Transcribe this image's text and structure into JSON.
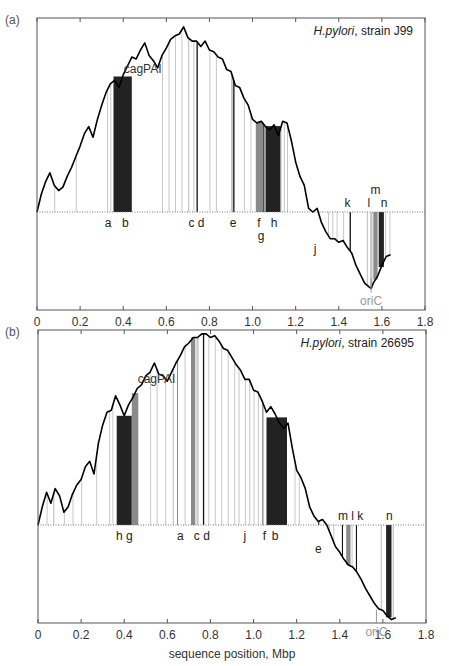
{
  "chart_data": {
    "type": "line",
    "xlabel": "sequence position, Mbp",
    "xlim": [
      0,
      1.8
    ],
    "xticks": [
      "0",
      "0.2",
      "0.4",
      "0.6",
      "0.8",
      "1.0",
      "1.2",
      "1.4",
      "1.6",
      "1.8"
    ],
    "xtick_values": [
      0,
      0.2,
      0.4,
      0.6,
      0.8,
      1.0,
      1.2,
      1.4,
      1.6,
      1.8
    ],
    "grid": false,
    "panels": [
      {
        "label": "(a)",
        "title_italic": "H.pylori",
        "title_rest": ", strain J99",
        "annotation": "cagPAI",
        "annotation_x": 0.49,
        "annotation_y": 0.78,
        "oric_label": "oriC",
        "oric_x": 1.55,
        "ylim": [
          -0.5,
          1.05
        ],
        "curve": {
          "x": [
            0,
            0.02,
            0.04,
            0.06,
            0.08,
            0.1,
            0.12,
            0.14,
            0.16,
            0.18,
            0.2,
            0.22,
            0.24,
            0.26,
            0.28,
            0.3,
            0.32,
            0.34,
            0.36,
            0.38,
            0.4,
            0.42,
            0.44,
            0.46,
            0.48,
            0.5,
            0.52,
            0.54,
            0.56,
            0.58,
            0.6,
            0.62,
            0.64,
            0.66,
            0.68,
            0.7,
            0.72,
            0.74,
            0.76,
            0.78,
            0.8,
            0.82,
            0.84,
            0.86,
            0.88,
            0.9,
            0.92,
            0.94,
            0.96,
            0.98,
            1.0,
            1.02,
            1.04,
            1.06,
            1.08,
            1.1,
            1.12,
            1.14,
            1.16,
            1.18,
            1.2,
            1.22,
            1.24,
            1.26,
            1.28,
            1.3,
            1.32,
            1.34,
            1.36,
            1.38,
            1.4,
            1.42,
            1.44,
            1.46,
            1.48,
            1.5,
            1.52,
            1.54,
            1.55,
            1.56,
            1.58,
            1.6,
            1.62,
            1.64
          ],
          "y": [
            0.0,
            0.1,
            0.17,
            0.22,
            0.15,
            0.12,
            0.14,
            0.2,
            0.25,
            0.31,
            0.37,
            0.44,
            0.48,
            0.42,
            0.52,
            0.6,
            0.67,
            0.72,
            0.74,
            0.7,
            0.77,
            0.82,
            0.87,
            0.86,
            0.91,
            0.95,
            0.88,
            0.85,
            0.81,
            0.88,
            0.92,
            0.97,
            0.99,
            1.0,
            1.04,
            0.98,
            0.96,
            0.96,
            0.93,
            0.96,
            0.91,
            0.9,
            0.87,
            0.86,
            0.8,
            0.79,
            0.71,
            0.7,
            0.64,
            0.6,
            0.52,
            0.5,
            0.51,
            0.48,
            0.46,
            0.49,
            0.43,
            0.51,
            0.5,
            0.4,
            0.28,
            0.2,
            0.15,
            0.02,
            0.0,
            0.02,
            -0.06,
            -0.11,
            -0.15,
            -0.15,
            -0.17,
            -0.16,
            -0.2,
            -0.23,
            -0.3,
            -0.35,
            -0.4,
            -0.42,
            -0.43,
            -0.4,
            -0.36,
            -0.3,
            -0.25,
            -0.24
          ]
        },
        "bars": [
          {
            "x": 0.08,
            "w": 0.003,
            "shade": "light"
          },
          {
            "x": 0.18,
            "w": 0.003,
            "shade": "light"
          },
          {
            "x": 0.325,
            "w": 0.004,
            "shade": "light"
          },
          {
            "x": 0.34,
            "w": 0.004,
            "shade": "light"
          },
          {
            "x": 0.355,
            "w": 0.085,
            "shade": "dark"
          },
          {
            "x": 0.58,
            "w": 0.004,
            "shade": "light"
          },
          {
            "x": 0.61,
            "w": 0.004,
            "shade": "light"
          },
          {
            "x": 0.64,
            "w": 0.004,
            "shade": "light"
          },
          {
            "x": 0.67,
            "w": 0.004,
            "shade": "light"
          },
          {
            "x": 0.7,
            "w": 0.006,
            "shade": "light"
          },
          {
            "x": 0.725,
            "w": 0.004,
            "shade": "light"
          },
          {
            "x": 0.74,
            "w": 0.006,
            "shade": "black"
          },
          {
            "x": 0.8,
            "w": 0.004,
            "shade": "light"
          },
          {
            "x": 0.83,
            "w": 0.004,
            "shade": "light"
          },
          {
            "x": 0.9,
            "w": 0.01,
            "shade": "light"
          },
          {
            "x": 0.91,
            "w": 0.006,
            "shade": "black"
          },
          {
            "x": 0.96,
            "w": 0.004,
            "shade": "light"
          },
          {
            "x": 0.99,
            "w": 0.004,
            "shade": "light"
          },
          {
            "x": 1.015,
            "w": 0.035,
            "shade": "medium"
          },
          {
            "x": 1.05,
            "w": 0.005,
            "shade": "black"
          },
          {
            "x": 1.06,
            "w": 0.07,
            "shade": "dark"
          },
          {
            "x": 1.13,
            "w": 0.004,
            "shade": "light"
          },
          {
            "x": 1.145,
            "w": 0.004,
            "shade": "light"
          },
          {
            "x": 1.16,
            "w": 0.004,
            "shade": "light"
          },
          {
            "x": 1.35,
            "w": 0.004,
            "shade": "light"
          },
          {
            "x": 1.37,
            "w": 0.004,
            "shade": "light"
          },
          {
            "x": 1.39,
            "w": 0.004,
            "shade": "light"
          },
          {
            "x": 1.42,
            "w": 0.004,
            "shade": "light"
          },
          {
            "x": 1.45,
            "w": 0.006,
            "shade": "black"
          },
          {
            "x": 1.53,
            "w": 0.006,
            "shade": "light"
          },
          {
            "x": 1.545,
            "w": 0.012,
            "shade": "light"
          },
          {
            "x": 1.56,
            "w": 0.02,
            "shade": "medium"
          },
          {
            "x": 1.585,
            "w": 0.024,
            "shade": "dark"
          },
          {
            "x": 1.615,
            "w": 0.004,
            "shade": "light"
          },
          {
            "x": 1.635,
            "w": 0.004,
            "shade": "light"
          }
        ],
        "labels": [
          {
            "text": "a",
            "x": 0.33,
            "row": 0
          },
          {
            "text": "b",
            "x": 0.41,
            "row": 0
          },
          {
            "text": "c d",
            "x": 0.74,
            "row": 0
          },
          {
            "text": "e",
            "x": 0.91,
            "row": 0
          },
          {
            "text": "f",
            "x": 1.03,
            "row": 0
          },
          {
            "text": "h",
            "x": 1.1,
            "row": 0
          },
          {
            "text": "g",
            "x": 1.04,
            "row": 1
          },
          {
            "text": "j",
            "x": 1.29,
            "row": 2
          },
          {
            "text": "k",
            "x": 1.44,
            "row": -1
          },
          {
            "text": "l",
            "x": 1.54,
            "row": -1
          },
          {
            "text": "m",
            "x": 1.57,
            "row": -2
          },
          {
            "text": "n",
            "x": 1.61,
            "row": -1
          }
        ]
      },
      {
        "label": "(b)",
        "title_italic": "H.pylori",
        "title_rest": ", strain 26695",
        "annotation": "cagPAI",
        "annotation_x": 0.55,
        "annotation_y": 0.78,
        "oric_label": "oriC",
        "oric_x": 1.57,
        "ylim": [
          -0.5,
          1.05
        ],
        "curve": {
          "x": [
            0,
            0.02,
            0.04,
            0.06,
            0.08,
            0.1,
            0.12,
            0.14,
            0.16,
            0.18,
            0.2,
            0.22,
            0.24,
            0.26,
            0.28,
            0.3,
            0.32,
            0.34,
            0.36,
            0.38,
            0.4,
            0.42,
            0.44,
            0.46,
            0.48,
            0.5,
            0.52,
            0.54,
            0.56,
            0.58,
            0.6,
            0.62,
            0.64,
            0.66,
            0.68,
            0.7,
            0.72,
            0.74,
            0.76,
            0.78,
            0.8,
            0.82,
            0.84,
            0.86,
            0.88,
            0.9,
            0.92,
            0.94,
            0.96,
            0.98,
            1.0,
            1.02,
            1.04,
            1.06,
            1.08,
            1.1,
            1.12,
            1.14,
            1.16,
            1.18,
            1.2,
            1.22,
            1.24,
            1.26,
            1.28,
            1.3,
            1.32,
            1.34,
            1.36,
            1.38,
            1.4,
            1.42,
            1.44,
            1.46,
            1.48,
            1.5,
            1.52,
            1.54,
            1.56,
            1.58,
            1.6,
            1.62,
            1.64,
            1.66
          ],
          "y": [
            0.0,
            0.1,
            0.18,
            0.12,
            0.2,
            0.16,
            0.07,
            0.1,
            0.17,
            0.22,
            0.25,
            0.32,
            0.35,
            0.28,
            0.45,
            0.55,
            0.62,
            0.63,
            0.71,
            0.66,
            0.6,
            0.66,
            0.7,
            0.75,
            0.77,
            0.82,
            0.84,
            0.89,
            0.83,
            0.82,
            0.79,
            0.84,
            0.89,
            0.93,
            0.98,
            1.0,
            1.03,
            1.03,
            1.05,
            1.05,
            1.03,
            1.04,
            1.01,
            0.97,
            0.96,
            0.92,
            0.88,
            0.85,
            0.8,
            0.8,
            0.74,
            0.73,
            0.68,
            0.62,
            0.65,
            0.61,
            0.56,
            0.53,
            0.56,
            0.42,
            0.3,
            0.26,
            0.2,
            0.1,
            0.05,
            0.02,
            0.03,
            0.0,
            -0.06,
            -0.12,
            -0.15,
            -0.19,
            -0.22,
            -0.23,
            -0.26,
            -0.3,
            -0.35,
            -0.39,
            -0.43,
            -0.46,
            -0.47,
            -0.5,
            -0.52,
            -0.51
          ]
        },
        "bars": [
          {
            "x": 0.04,
            "w": 0.004,
            "shade": "light"
          },
          {
            "x": 0.07,
            "w": 0.006,
            "shade": "light"
          },
          {
            "x": 0.12,
            "w": 0.004,
            "shade": "light"
          },
          {
            "x": 0.16,
            "w": 0.004,
            "shade": "light"
          },
          {
            "x": 0.2,
            "w": 0.004,
            "shade": "light"
          },
          {
            "x": 0.27,
            "w": 0.004,
            "shade": "light"
          },
          {
            "x": 0.33,
            "w": 0.004,
            "shade": "light"
          },
          {
            "x": 0.345,
            "w": 0.004,
            "shade": "light"
          },
          {
            "x": 0.365,
            "w": 0.07,
            "shade": "dark"
          },
          {
            "x": 0.435,
            "w": 0.03,
            "shade": "medium"
          },
          {
            "x": 0.52,
            "w": 0.004,
            "shade": "light"
          },
          {
            "x": 0.55,
            "w": 0.004,
            "shade": "light"
          },
          {
            "x": 0.59,
            "w": 0.004,
            "shade": "light"
          },
          {
            "x": 0.625,
            "w": 0.006,
            "shade": "light"
          },
          {
            "x": 0.645,
            "w": 0.004,
            "shade": "medium"
          },
          {
            "x": 0.68,
            "w": 0.004,
            "shade": "light"
          },
          {
            "x": 0.71,
            "w": 0.02,
            "shade": "medium"
          },
          {
            "x": 0.735,
            "w": 0.01,
            "shade": "light"
          },
          {
            "x": 0.765,
            "w": 0.006,
            "shade": "black"
          },
          {
            "x": 0.79,
            "w": 0.004,
            "shade": "light"
          },
          {
            "x": 0.82,
            "w": 0.004,
            "shade": "light"
          },
          {
            "x": 0.85,
            "w": 0.004,
            "shade": "light"
          },
          {
            "x": 0.88,
            "w": 0.004,
            "shade": "light"
          },
          {
            "x": 0.91,
            "w": 0.004,
            "shade": "light"
          },
          {
            "x": 0.93,
            "w": 0.004,
            "shade": "light"
          },
          {
            "x": 0.96,
            "w": 0.004,
            "shade": "light"
          },
          {
            "x": 0.98,
            "w": 0.004,
            "shade": "light"
          },
          {
            "x": 1.0,
            "w": 0.004,
            "shade": "light"
          },
          {
            "x": 1.02,
            "w": 0.004,
            "shade": "light"
          },
          {
            "x": 1.04,
            "w": 0.006,
            "shade": "medium"
          },
          {
            "x": 1.06,
            "w": 0.095,
            "shade": "dark"
          },
          {
            "x": 1.19,
            "w": 0.004,
            "shade": "light"
          },
          {
            "x": 1.21,
            "w": 0.004,
            "shade": "light"
          },
          {
            "x": 1.3,
            "w": 0.005,
            "shade": "black"
          },
          {
            "x": 1.35,
            "w": 0.004,
            "shade": "light"
          },
          {
            "x": 1.37,
            "w": 0.004,
            "shade": "light"
          },
          {
            "x": 1.41,
            "w": 0.005,
            "shade": "black"
          },
          {
            "x": 1.43,
            "w": 0.02,
            "shade": "medium"
          },
          {
            "x": 1.455,
            "w": 0.004,
            "shade": "light"
          },
          {
            "x": 1.475,
            "w": 0.005,
            "shade": "black"
          },
          {
            "x": 1.59,
            "w": 0.006,
            "shade": "light"
          },
          {
            "x": 1.615,
            "w": 0.025,
            "shade": "dark"
          },
          {
            "x": 1.645,
            "w": 0.006,
            "shade": "light"
          }
        ],
        "labels": [
          {
            "text": "h g",
            "x": 0.4,
            "row": 0
          },
          {
            "text": "a",
            "x": 0.66,
            "row": 0
          },
          {
            "text": "c d",
            "x": 0.76,
            "row": 0
          },
          {
            "text": "j",
            "x": 0.96,
            "row": 0
          },
          {
            "text": "f",
            "x": 1.05,
            "row": 0
          },
          {
            "text": "b",
            "x": 1.1,
            "row": 0
          },
          {
            "text": "e",
            "x": 1.3,
            "row": 1
          },
          {
            "text": "m l k",
            "x": 1.45,
            "row": -1
          },
          {
            "text": "n",
            "x": 1.63,
            "row": -1
          }
        ]
      }
    ]
  }
}
